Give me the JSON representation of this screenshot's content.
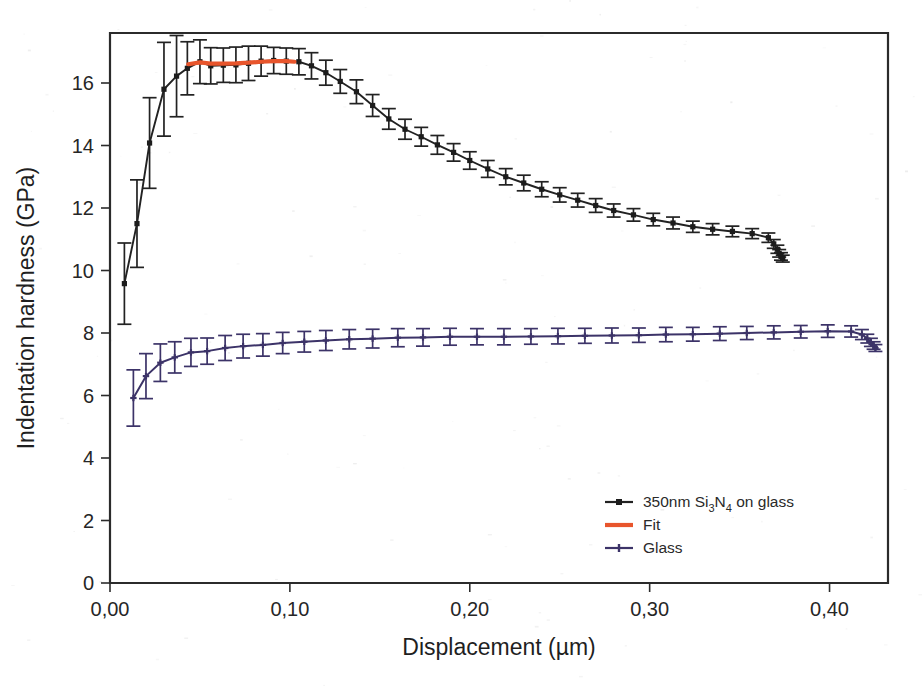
{
  "chart_data": {
    "type": "line",
    "title": "",
    "xlabel": "Displacement (µm)",
    "ylabel": "Indentation hardness (GPa)",
    "xlim": [
      0.0,
      0.4325
    ],
    "ylim": [
      0.0,
      17.6
    ],
    "xticks": [
      0.0,
      0.1,
      0.2,
      0.3,
      0.4
    ],
    "xticklabels": [
      "0,00",
      "0,10",
      "0,20",
      "0,30",
      "0,40"
    ],
    "yticks": [
      0,
      2,
      4,
      6,
      8,
      10,
      12,
      14,
      16
    ],
    "yticklabels": [
      "0",
      "2",
      "4",
      "6",
      "8",
      "10",
      "12",
      "14",
      "16"
    ],
    "grid": false,
    "legend_position": "lower right",
    "decimal_separator": ",",
    "error_bars": true,
    "colors": {
      "film": "#222222",
      "fit": "#e8552c",
      "glass": "#3c3368",
      "axis": "#2b2b2b",
      "background": "#ffffff"
    },
    "series": [
      {
        "name": "350nm Si3N4 on glass",
        "legend_label_parts": {
          "prefix": "350nm Si",
          "sub1": "3",
          "mid": "N",
          "sub2": "4",
          "suffix": " on glass"
        },
        "color": "#222222",
        "marker": "square",
        "x": [
          0.008,
          0.015,
          0.022,
          0.03,
          0.037,
          0.043,
          0.05,
          0.056,
          0.063,
          0.07,
          0.077,
          0.084,
          0.091,
          0.098,
          0.105,
          0.112,
          0.12,
          0.128,
          0.137,
          0.146,
          0.155,
          0.164,
          0.173,
          0.182,
          0.191,
          0.2,
          0.21,
          0.22,
          0.23,
          0.24,
          0.25,
          0.26,
          0.27,
          0.28,
          0.291,
          0.302,
          0.313,
          0.324,
          0.335,
          0.346,
          0.357,
          0.366,
          0.369,
          0.371,
          0.372,
          0.373,
          0.374
        ],
        "y": [
          9.58,
          11.5,
          14.08,
          15.8,
          16.22,
          16.47,
          16.68,
          16.55,
          16.57,
          16.58,
          16.63,
          16.7,
          16.72,
          16.7,
          16.68,
          16.55,
          16.33,
          16.05,
          15.72,
          15.28,
          14.85,
          14.52,
          14.28,
          14.02,
          13.78,
          13.52,
          13.25,
          13.0,
          12.8,
          12.6,
          12.42,
          12.25,
          12.08,
          11.92,
          11.78,
          11.63,
          11.52,
          11.4,
          11.32,
          11.25,
          11.18,
          11.05,
          10.85,
          10.68,
          10.55,
          10.45,
          10.38
        ],
        "yerr": [
          1.3,
          1.4,
          1.45,
          1.5,
          1.3,
          0.85,
          0.7,
          0.58,
          0.55,
          0.57,
          0.55,
          0.48,
          0.42,
          0.42,
          0.42,
          0.42,
          0.4,
          0.38,
          0.38,
          0.35,
          0.33,
          0.32,
          0.3,
          0.3,
          0.28,
          0.28,
          0.27,
          0.26,
          0.25,
          0.24,
          0.23,
          0.22,
          0.22,
          0.21,
          0.2,
          0.2,
          0.19,
          0.18,
          0.18,
          0.17,
          0.16,
          0.15,
          0.14,
          0.13,
          0.12,
          0.12,
          0.11
        ]
      },
      {
        "name": "Fit",
        "legend_label_parts": {
          "prefix": "Fit",
          "sub1": "",
          "mid": "",
          "sub2": "",
          "suffix": ""
        },
        "color": "#e8552c",
        "marker": "none",
        "x": [
          0.0435,
          0.05,
          0.056,
          0.063,
          0.07,
          0.077,
          0.084,
          0.091,
          0.098,
          0.1025
        ],
        "y": [
          16.6,
          16.66,
          16.62,
          16.62,
          16.63,
          16.65,
          16.68,
          16.7,
          16.7,
          16.68
        ],
        "yerr": []
      },
      {
        "name": "Glass",
        "legend_label_parts": {
          "prefix": "Glass",
          "sub1": "",
          "mid": "",
          "sub2": "",
          "suffix": ""
        },
        "color": "#3c3368",
        "marker": "plus",
        "x": [
          0.013,
          0.02,
          0.028,
          0.036,
          0.045,
          0.054,
          0.064,
          0.074,
          0.085,
          0.096,
          0.108,
          0.12,
          0.133,
          0.146,
          0.16,
          0.174,
          0.189,
          0.204,
          0.219,
          0.234,
          0.249,
          0.264,
          0.279,
          0.294,
          0.309,
          0.324,
          0.339,
          0.354,
          0.369,
          0.384,
          0.399,
          0.412,
          0.418,
          0.421,
          0.423,
          0.4245,
          0.4255
        ],
        "y": [
          5.92,
          6.62,
          7.05,
          7.22,
          7.38,
          7.42,
          7.52,
          7.58,
          7.62,
          7.68,
          7.72,
          7.76,
          7.8,
          7.82,
          7.85,
          7.86,
          7.88,
          7.88,
          7.88,
          7.89,
          7.9,
          7.91,
          7.92,
          7.93,
          7.95,
          7.96,
          7.98,
          8.0,
          8.02,
          8.04,
          8.06,
          8.05,
          7.95,
          7.82,
          7.7,
          7.6,
          7.52
        ],
        "yerr": [
          0.9,
          0.72,
          0.6,
          0.5,
          0.45,
          0.42,
          0.4,
          0.38,
          0.36,
          0.34,
          0.33,
          0.32,
          0.31,
          0.3,
          0.29,
          0.28,
          0.27,
          0.26,
          0.26,
          0.25,
          0.25,
          0.24,
          0.24,
          0.23,
          0.23,
          0.22,
          0.22,
          0.21,
          0.21,
          0.2,
          0.2,
          0.18,
          0.16,
          0.14,
          0.13,
          0.12,
          0.11
        ]
      }
    ],
    "legend_entries": [
      {
        "label": "350nm Si3N4 on glass",
        "color": "#222222",
        "style": "line-marker"
      },
      {
        "label": "Fit",
        "color": "#e8552c",
        "style": "line"
      },
      {
        "label": "Glass",
        "color": "#3c3368",
        "style": "line-marker"
      }
    ]
  }
}
